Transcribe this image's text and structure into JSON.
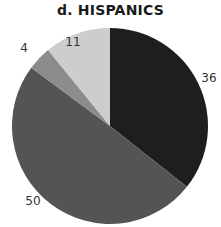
{
  "chart_data": {
    "type": "pie",
    "title": "d. HISPANICS",
    "categories": [
      "Segment 1",
      "Segment 2",
      "Segment 3",
      "Segment 4"
    ],
    "values": [
      36,
      50,
      4,
      11
    ],
    "labels": [
      "36",
      "50",
      "4",
      "11"
    ],
    "colors": [
      "#1e1e1e",
      "#545454",
      "#8c8c8c",
      "#cdcdcd"
    ],
    "start_angle_deg": 0,
    "direction": "clockwise",
    "legend": "none",
    "center": [
      110,
      126
    ],
    "radius": 98,
    "label_positions": [
      [
        209,
        78
      ],
      [
        33,
        201
      ],
      [
        24,
        48
      ],
      [
        73,
        42
      ]
    ]
  }
}
